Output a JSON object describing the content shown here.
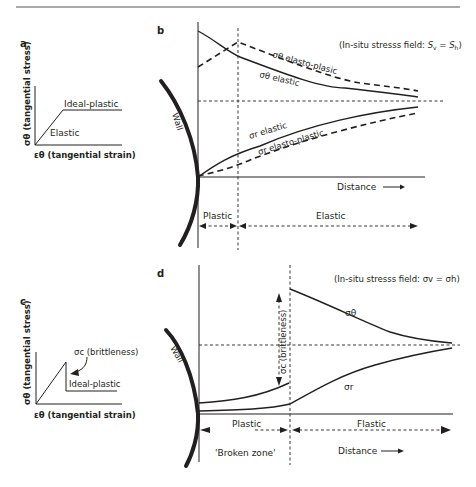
{
  "header": {
    "rule": "top-rule"
  },
  "panel_a": {
    "label": "a",
    "y_axis": "σθ (tangential stress)",
    "x_axis": "εθ (tangential strain)",
    "elastic": "Elastic",
    "ideal_plastic": "Ideal-plastic"
  },
  "panel_b": {
    "label": "b",
    "field": "(In-situ stresss field: Sv = Sh)",
    "field_prefix": "(In-situ stresss field: ",
    "field_sv": "S",
    "field_sv_sub": "v",
    "field_eq": " = ",
    "field_sh": "S",
    "field_sh_sub": "h",
    "field_suffix": ")",
    "theta_elasto": "σθ elasto-plasic",
    "theta_elastic": "σθ elastic",
    "r_elastic": "σr elastic",
    "r_elasto": "σr elasto-plastic",
    "wall": "Wall",
    "distance": "Distance",
    "plastic": "Plastic",
    "elastic_zone": "Elastic"
  },
  "panel_c": {
    "label": "c",
    "y_axis": "σθ (tangential stress)",
    "x_axis": "εθ (tangential strain)",
    "brittleness": "σc (brittleness)",
    "ideal_plastic": "Ideal-plastic"
  },
  "panel_d": {
    "label": "d",
    "field": "(In-situ stresss field: σv = σh)",
    "sigma_theta": "σθ",
    "sigma_r": "σr",
    "brittleness": "σc (brittleness)",
    "wall": "Wall",
    "plastic": "Plastic",
    "elastic_zone": "Flastic",
    "broken_zone": "'Broken zone'",
    "distance": "Distance"
  }
}
